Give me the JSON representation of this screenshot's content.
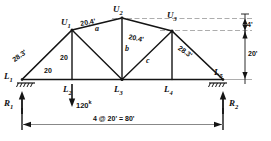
{
  "figure": {
    "type": "structural-truss-diagram"
  },
  "joints": {
    "L1": "L",
    "L1_sub": "1",
    "L2": "L",
    "L2_sub": "2",
    "L3": "L",
    "L3_sub": "3",
    "L4": "L",
    "L4_sub": "4",
    "L5": "L",
    "L5_sub": "5",
    "U1": "U",
    "U1_sub": "1",
    "U2": "U",
    "U2_sub": "2",
    "U3": "U",
    "U3_sub": "3"
  },
  "member_labels": {
    "a": "a",
    "b": "b",
    "c": "c"
  },
  "lengths": {
    "left_end_post": "28.3'",
    "right_end_post": "28.3'",
    "top_left_panel": "20.4'",
    "top_right_panel": "20.4'",
    "vertical_U1_L2": "20",
    "bottom_L1_L2": "20"
  },
  "dimensions": {
    "rise": "20'",
    "top_offset": "4'",
    "span": "4 @ 20' = 80'"
  },
  "loads": {
    "P_at_L2_value": "120",
    "P_at_L2_unit": "k"
  },
  "reactions": {
    "R1": "R",
    "R1_sub": "1",
    "R2": "R",
    "R2_sub": "2"
  },
  "colors": {
    "line": "#1a1a1a",
    "dim_line": "#6d6d6d",
    "background": "#ffffff"
  }
}
